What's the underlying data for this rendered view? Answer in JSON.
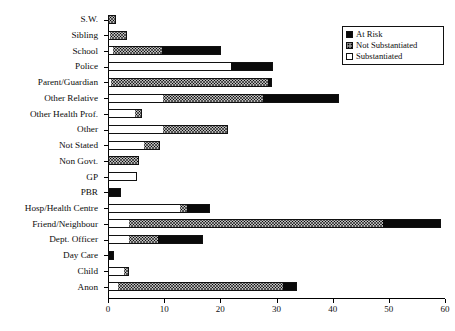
{
  "chart_data": {
    "type": "bar",
    "orientation": "horizontal",
    "stacked": true,
    "title": "",
    "xlabel": "",
    "ylabel": "",
    "xlim": [
      0,
      60
    ],
    "xticks": [
      0,
      10,
      20,
      30,
      40,
      50,
      60
    ],
    "xtick_labels": [
      "0",
      "10",
      "20",
      "30",
      "40",
      "50",
      "60"
    ],
    "grid": false,
    "legend_position": "top-right",
    "categories": [
      "S.W.",
      "Sibling",
      "School",
      "Police",
      "Parent/Guardian",
      "Other Relative",
      "Other Health Prof.",
      "Other",
      "Not Stated",
      "Non Govt.",
      "GP",
      "PBR",
      "Hosp/Health Centre",
      "Friend/Neighbour",
      "Dept. Officer",
      "Day Care",
      "Child",
      "Anon"
    ],
    "series": [
      {
        "name": "Substantiated",
        "values": [
          0.3,
          0.5,
          1.0,
          22.0,
          0.8,
          10.0,
          5.0,
          10.0,
          6.5,
          0.0,
          5.2,
          0.0,
          13.0,
          4.0,
          4.0,
          0.0,
          3.0,
          2.0
        ]
      },
      {
        "name": "Not Substantiated",
        "values": [
          1.2,
          3.0,
          9.0,
          0.0,
          28.0,
          18.0,
          1.2,
          11.5,
          3.0,
          5.5,
          0.0,
          0.0,
          1.5,
          45.3,
          5.3,
          0.0,
          1.0,
          29.5
        ]
      },
      {
        "name": "At Risk",
        "values": [
          0.0,
          0.0,
          10.5,
          7.5,
          0.7,
          13.5,
          0.3,
          0.0,
          0.0,
          0.0,
          0.0,
          2.3,
          4.0,
          10.3,
          8.0,
          1.0,
          0.0,
          2.5
        ]
      }
    ],
    "totals": [
      1.5,
      3.5,
      20.5,
      29.5,
      29.5,
      41.5,
      6.5,
      21.5,
      9.5,
      5.5,
      5.2,
      2.3,
      18.5,
      59.6,
      17.3,
      1.0,
      4.0,
      34.0
    ],
    "colors": {
      "At Risk": "#0a0a0a",
      "Not Substantiated": "#6e6e6e",
      "Substantiated": "#ffffff",
      "axis": "#000000"
    }
  },
  "legend": {
    "items": [
      {
        "label": "At Risk",
        "swatch": "solid-black-swatch"
      },
      {
        "label": "Not Substantiated",
        "swatch": "stippled-gray-swatch"
      },
      {
        "label": "Substantiated",
        "swatch": "empty-white-swatch"
      }
    ]
  }
}
